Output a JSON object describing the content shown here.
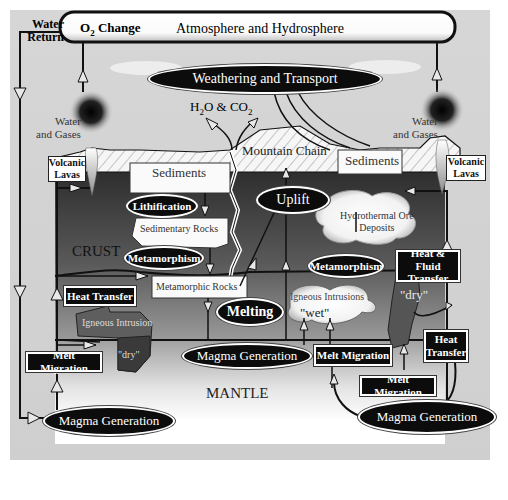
{
  "diagram": {
    "atmosphere_bar": {
      "o2_label_main": "O",
      "o2_label_sub": "2",
      "o2_label_rest": " Change",
      "title": "Atmosphere and Hydrosphere"
    },
    "water_return": {
      "line1": "Water",
      "line2": "Return"
    },
    "weathering": "Weathering and Transport",
    "gases": {
      "h": "H",
      "sub1": "2",
      "o_and_co": "O & CO",
      "sub2": "2"
    },
    "volcano_left": {
      "gases_line1": "Water",
      "gases_line2": "and Gases",
      "lavas_line1": "Volcanic",
      "lavas_line2": "Lavas"
    },
    "volcano_right": {
      "gases_line1": "Water",
      "gases_line2": "and Gases",
      "lavas_line1": "Volcanic",
      "lavas_line2": "Lavas"
    },
    "mountain_chain": "Mountain Chain",
    "sediments_left": "Sediments",
    "sediments_right": "Sediments",
    "lithification": "Lithification",
    "sedimentary_rocks": "Sedimentary Rocks",
    "crust_label": "CRUST",
    "metamorphism_left": "Metamorphism",
    "metamorphic_rocks": "Metamorphic Rocks",
    "uplift": "Uplift",
    "hydrothermal": {
      "line1": "Hydrothermal Ore",
      "line2": "Deposits"
    },
    "metamorphism_right": "Metamorphism",
    "heat_fluid_transfer": {
      "line1": "Heat & Fluid",
      "line2": "Transfer"
    },
    "heat_transfer_left": "Heat Transfer",
    "igneous_intrusion_left": "Igneous Intrusion",
    "dry_left": "\"dry\"",
    "melting": "Melting",
    "igneous_intrusions_right": "Igneous Intrusions",
    "wet": "\"wet\"",
    "dry_right": "\"dry\"",
    "melt_migration_left": "Melt Migration",
    "magma_generation_center": "Magma Generation",
    "melt_migration_center": "Melt Migration",
    "heat_transfer_right": {
      "line1": "Heat",
      "line2": "Transfer"
    },
    "mantle_label": "MANTLE",
    "melt_migration_bottom": "Melt Migration",
    "magma_generation_left": "Magma Generation",
    "magma_generation_right": "Magma Generation"
  },
  "colors": {
    "background": "#d2d2d2",
    "crust_top": "#3e3e3e",
    "crust_bottom": "#9a9a9a",
    "mantle_top": "#9c9c9c",
    "mantle_bottom": "#ffffff",
    "label_dark": "#0c0c0c"
  }
}
